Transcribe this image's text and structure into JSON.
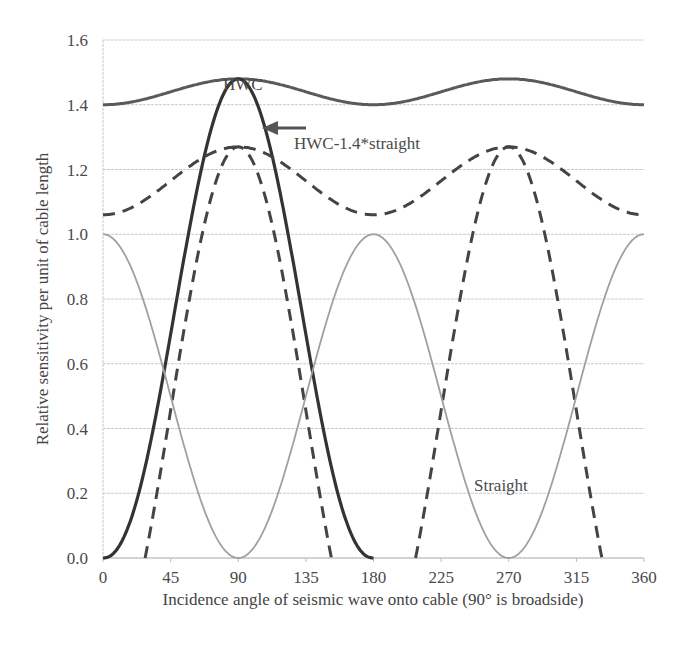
{
  "chart_data": {
    "type": "line",
    "title": "",
    "xlabel": "Incidence angle of seismic wave onto cable (90° is broadside)",
    "ylabel": "Relative sensitivity per unit of cable length",
    "xlim": [
      0,
      360
    ],
    "ylim": [
      0,
      1.6
    ],
    "grid": "horizontal",
    "x_ticks": [
      0,
      45,
      90,
      135,
      180,
      225,
      270,
      315,
      360
    ],
    "x_tick_labels": [
      "0",
      "45",
      "90",
      "135",
      "180",
      "225",
      "270",
      "315",
      "360"
    ],
    "y_ticks": [
      0.0,
      0.2,
      0.4,
      0.6,
      0.8,
      1.0,
      1.2,
      1.4,
      1.6
    ],
    "y_tick_labels": [
      "0.0",
      "0.2",
      "0.4",
      "0.6",
      "0.8",
      "1.0",
      "1.2",
      "1.4",
      "1.6"
    ],
    "series": [
      {
        "name": "HWC",
        "style": "solid-dark",
        "color": "#555555",
        "x": [
          0,
          45,
          90,
          135,
          180,
          225,
          270,
          315,
          360
        ],
        "values": [
          1.4,
          1.44,
          1.48,
          1.44,
          1.4,
          1.44,
          1.48,
          1.44,
          1.4
        ]
      },
      {
        "name": "HWC inline",
        "style": "solid-dark-thick",
        "color": "#3a3a3a",
        "x": [
          0,
          45,
          90,
          135,
          180,
          225,
          270,
          315,
          360
        ],
        "values": [
          0.0,
          0.74,
          1.48,
          0.74,
          0.0,
          0.74,
          1.48,
          0.74,
          0.0
        ]
      },
      {
        "name": "HWC-1.4*straight (envelope)",
        "style": "dashed",
        "color": "#444444",
        "x": [
          0,
          45,
          90,
          135,
          180,
          225,
          270,
          315,
          360
        ],
        "values": [
          1.06,
          1.17,
          1.27,
          1.17,
          1.06,
          1.17,
          1.27,
          1.17,
          1.06
        ]
      },
      {
        "name": "HWC-1.4*straight",
        "style": "dashed",
        "color": "#444444",
        "x": [
          28,
          45,
          90,
          135,
          152,
          208,
          225,
          270,
          315,
          332
        ],
        "values": [
          0.0,
          0.45,
          1.27,
          0.45,
          0.0,
          0.0,
          0.45,
          1.27,
          0.45,
          0.0
        ]
      },
      {
        "name": "Straight",
        "style": "solid-light",
        "color": "#9a9a9a",
        "x": [
          0,
          45,
          90,
          135,
          180,
          225,
          270,
          315,
          360
        ],
        "values": [
          1.0,
          0.5,
          0.0,
          0.5,
          1.0,
          0.5,
          0.0,
          0.5,
          1.0
        ]
      }
    ],
    "annotations": [
      {
        "text": "HWC",
        "x": 90,
        "y": 1.52
      },
      {
        "text": "HWC-1.4*straight",
        "x": 112,
        "y": 1.33,
        "arrow_to": [
          98,
          1.37
        ]
      },
      {
        "text": "Straight",
        "x": 225,
        "y": 0.22
      }
    ]
  }
}
